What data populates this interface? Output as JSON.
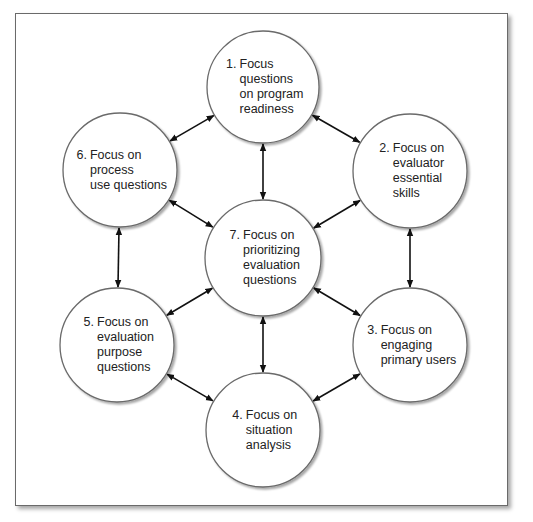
{
  "diagram": {
    "type": "hub-and-ring",
    "nodes": [
      {
        "id": 1,
        "number": "1.",
        "lines": [
          "Focus",
          "questions",
          "on program",
          "readiness"
        ],
        "cx": 263,
        "cy": 87,
        "r": 56
      },
      {
        "id": 2,
        "number": "2.",
        "lines": [
          "Focus on",
          "evaluator",
          "essential",
          "skills"
        ],
        "cx": 410,
        "cy": 171,
        "r": 57
      },
      {
        "id": 3,
        "number": "3.",
        "lines": [
          "Focus on",
          "engaging",
          "primary users"
        ],
        "cx": 410,
        "cy": 345,
        "r": 57
      },
      {
        "id": 4,
        "number": "4.",
        "lines": [
          "Focus on",
          "situation",
          "analysis"
        ],
        "cx": 263,
        "cy": 430,
        "r": 57
      },
      {
        "id": 5,
        "number": "5.",
        "lines": [
          "Focus on",
          "evaluation",
          "purpose",
          "questions"
        ],
        "cx": 117,
        "cy": 345,
        "r": 57
      },
      {
        "id": 6,
        "number": "6.",
        "lines": [
          "Focus on",
          "process",
          "use questions"
        ],
        "cx": 120,
        "cy": 170,
        "r": 57
      },
      {
        "id": 7,
        "number": "7.",
        "lines": [
          "Focus on",
          "prioritizing",
          "evaluation",
          "questions"
        ],
        "cx": 263,
        "cy": 258,
        "r": 58
      }
    ],
    "edges": [
      {
        "from": 1,
        "to": 2,
        "bidirectional": true
      },
      {
        "from": 2,
        "to": 3,
        "bidirectional": true
      },
      {
        "from": 3,
        "to": 4,
        "bidirectional": true
      },
      {
        "from": 4,
        "to": 5,
        "bidirectional": true
      },
      {
        "from": 5,
        "to": 6,
        "bidirectional": true
      },
      {
        "from": 6,
        "to": 1,
        "bidirectional": true
      },
      {
        "from": 7,
        "to": 1,
        "bidirectional": true
      },
      {
        "from": 7,
        "to": 2,
        "bidirectional": true
      },
      {
        "from": 7,
        "to": 3,
        "bidirectional": true
      },
      {
        "from": 7,
        "to": 4,
        "bidirectional": true
      },
      {
        "from": 7,
        "to": 5,
        "bidirectional": true
      },
      {
        "from": 7,
        "to": 6,
        "bidirectional": true
      }
    ],
    "colors": {
      "circle_stroke": "#6a6a6a",
      "circle_fill": "#ffffff",
      "arrow": "#111111",
      "frame": "#6a6a6a",
      "text": "#222222"
    }
  }
}
